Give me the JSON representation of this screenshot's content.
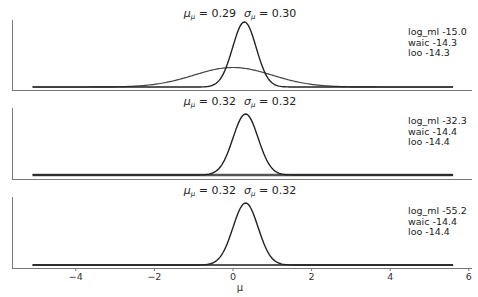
{
  "chart_data": [
    {
      "type": "line",
      "panel": 1,
      "title": "μ_μ = 0.29   σ_μ = 0.30",
      "title_parts": {
        "mu_label": "μ",
        "mu_sub": "μ",
        "mu_value": "0.29",
        "sigma_label": "σ",
        "sigma_sub": "μ",
        "sigma_value": "0.30"
      },
      "annotations": [
        "log_ml -15.0",
        "waic -14.3",
        "loo -14.3"
      ],
      "series": [
        {
          "name": "posterior",
          "kind": "normal",
          "mean": 0.29,
          "sd": 0.3,
          "color": "#222222",
          "width": 1.4
        },
        {
          "name": "prior",
          "kind": "normal",
          "mean": 0.0,
          "sd": 1.0,
          "color": "#444444",
          "width": 1.2
        }
      ],
      "xlim": [
        -5.1,
        5.6
      ],
      "grid": false
    },
    {
      "type": "line",
      "panel": 2,
      "title": "μ_μ = 0.32   σ_μ = 0.32",
      "title_parts": {
        "mu_label": "μ",
        "mu_sub": "μ",
        "mu_value": "0.32",
        "sigma_label": "σ",
        "sigma_sub": "μ",
        "sigma_value": "0.32"
      },
      "annotations": [
        "log_ml -32.3",
        "waic -14.4",
        "loo -14.4"
      ],
      "series": [
        {
          "name": "posterior",
          "kind": "normal",
          "mean": 0.32,
          "sd": 0.32,
          "color": "#222222",
          "width": 1.4
        },
        {
          "name": "prior",
          "kind": "flat",
          "color": "#555555",
          "width": 2.6
        }
      ],
      "xlim": [
        -5.1,
        5.6
      ],
      "grid": false
    },
    {
      "type": "line",
      "panel": 3,
      "title": "μ_μ = 0.32   σ_μ = 0.32",
      "title_parts": {
        "mu_label": "μ",
        "mu_sub": "μ",
        "mu_value": "0.32",
        "sigma_label": "σ",
        "sigma_sub": "μ",
        "sigma_value": "0.32"
      },
      "annotations": [
        "log_ml -55.2",
        "waic -14.4",
        "loo -14.4"
      ],
      "series": [
        {
          "name": "posterior",
          "kind": "normal",
          "mean": 0.32,
          "sd": 0.32,
          "color": "#222222",
          "width": 1.4
        },
        {
          "name": "prior",
          "kind": "flat",
          "color": "#555555",
          "width": 1.8
        }
      ],
      "xlim": [
        -5.1,
        5.6
      ],
      "xticks": [
        -4,
        -2,
        0,
        2,
        4,
        6
      ],
      "xtick_labels": [
        "−4",
        "−2",
        "0",
        "2",
        "4",
        "6"
      ],
      "xlabel": "μ",
      "grid": false
    }
  ],
  "layout": {
    "x_zero_px": 233,
    "px_per_unit": 39.3,
    "spine_left_x": 12,
    "spine_right_x": 472,
    "panels": [
      {
        "top": 20,
        "bottom": 90,
        "baseline": 87,
        "peak_height": 65,
        "title_y": 17
      },
      {
        "top": 108,
        "bottom": 179,
        "baseline": 175,
        "peak_height": 61,
        "title_y": 105
      },
      {
        "top": 197,
        "bottom": 268,
        "baseline": 265,
        "peak_height": 62,
        "title_y": 194
      }
    ]
  }
}
